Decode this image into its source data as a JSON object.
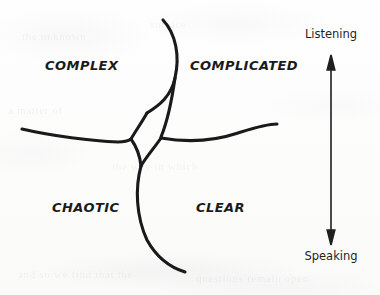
{
  "diagram": {
    "title_absent": true,
    "quadrants": [
      {
        "id": "complex",
        "label": "COMPLEX",
        "position": "top-left"
      },
      {
        "id": "complicated",
        "label": "COMPLICATED",
        "position": "top-right"
      },
      {
        "id": "chaotic",
        "label": "CHAOTIC",
        "position": "bottom-left"
      },
      {
        "id": "clear",
        "label": "CLEAR",
        "position": "bottom-right"
      }
    ],
    "axis": {
      "orientation": "vertical",
      "top_label": "Listening",
      "bottom_label": "Speaking",
      "arrow_style": "double-headed"
    },
    "colors": {
      "ink": "#1a1a1a",
      "paper": "#fdfdfc",
      "label_text": "#1b1b1b"
    },
    "ghost_bleed": [
      {
        "text": "the unknown",
        "x": 22,
        "y": 30
      },
      {
        "text": "surface",
        "x": 150,
        "y": 18
      },
      {
        "text": "a matter of",
        "x": 8,
        "y": 104
      },
      {
        "text": "the way in which",
        "x": 112,
        "y": 160
      },
      {
        "text": "and so we find that the",
        "x": 18,
        "y": 268
      },
      {
        "text": "questions remain open",
        "x": 196,
        "y": 272
      }
    ]
  }
}
